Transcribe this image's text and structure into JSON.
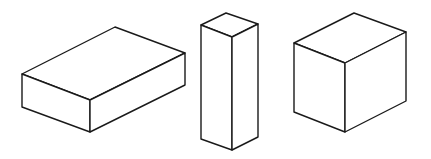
{
  "diagram": {
    "type": "isometric-solids",
    "shapes": [
      {
        "id": "flat-box",
        "label": "Flat rectangular box",
        "vertices": {
          "top_back": [
            115,
            27
          ],
          "top_left": [
            22,
            74
          ],
          "top_right": [
            185,
            53
          ],
          "top_front": [
            90,
            100
          ],
          "bottom_left": [
            22,
            107
          ],
          "bottom_front": [
            90,
            132
          ],
          "bottom_right": [
            185,
            85
          ]
        }
      },
      {
        "id": "tall-pillar",
        "label": "Tall square prism",
        "vertices": {
          "top_back": [
            226,
            13
          ],
          "top_left": [
            201,
            25
          ],
          "top_right": [
            258,
            24
          ],
          "top_front": [
            232,
            37
          ],
          "bottom_left": [
            201,
            139
          ],
          "bottom_front": [
            232,
            150
          ],
          "bottom_right": [
            258,
            137
          ]
        }
      },
      {
        "id": "cube",
        "label": "Cube",
        "vertices": {
          "top_back": [
            354,
            13
          ],
          "top_left": [
            294,
            43
          ],
          "top_right": [
            406,
            32
          ],
          "top_front": [
            345,
            63
          ],
          "bottom_left": [
            294,
            112
          ],
          "bottom_front": [
            345,
            132
          ],
          "bottom_right": [
            406,
            101
          ]
        }
      }
    ],
    "stroke_color": "#1a1a1a",
    "background": "#ffffff"
  }
}
